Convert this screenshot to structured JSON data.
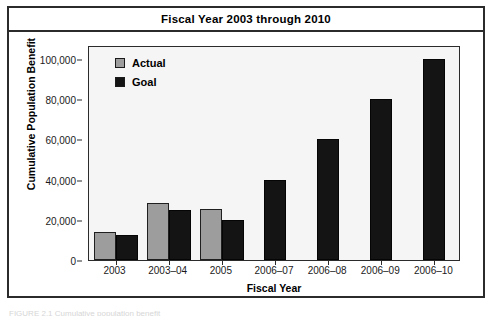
{
  "figure": {
    "title": "Fiscal Year 2003 through 2010",
    "caption_partial": "FIGURE 2.1  Cumulative population benefit"
  },
  "legend": {
    "position": "top-left",
    "items": [
      {
        "label": "Actual",
        "color": "#9d9d9d",
        "swatch": "legend-swatch-actual"
      },
      {
        "label": "Goal",
        "color": "#141414",
        "swatch": "legend-swatch-goal"
      }
    ]
  },
  "axes": {
    "ylabel": "Cumulative Population Benefit",
    "xlabel": "Fiscal Year",
    "yticks": [
      "0",
      "20,000",
      "40,000",
      "60,000",
      "80,000",
      "100,000"
    ],
    "ytick_values": [
      0,
      20000,
      40000,
      60000,
      80000,
      100000
    ],
    "ylim": [
      0,
      107000
    ],
    "grid": false
  },
  "chart_data": {
    "type": "bar",
    "title": "Fiscal Year 2003 through 2010",
    "xlabel": "Fiscal Year",
    "ylabel": "Cumulative Population Benefit",
    "categories": [
      "2003",
      "2003–04",
      "2005",
      "2006–07",
      "2006–08",
      "2006–09",
      "2006–10"
    ],
    "series": [
      {
        "name": "Actual",
        "color": "#9d9d9d",
        "values": [
          14000,
          28500,
          25500,
          null,
          null,
          null,
          null
        ]
      },
      {
        "name": "Goal",
        "color": "#141414",
        "values": [
          12500,
          25000,
          20000,
          40000,
          60000,
          80000,
          100000
        ]
      }
    ],
    "ylim": [
      0,
      107000
    ],
    "yticks": [
      0,
      20000,
      40000,
      60000,
      80000,
      100000
    ],
    "grid": false,
    "legend_position": "top-left"
  }
}
